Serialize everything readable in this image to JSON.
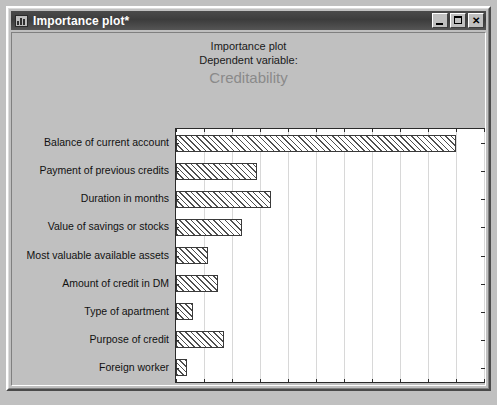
{
  "window": {
    "title": "Importance plot*",
    "icon": "bar-chart-icon",
    "buttons": {
      "minimize": "_",
      "maximize": "□",
      "close": "✕"
    }
  },
  "chart_data": {
    "type": "bar",
    "orientation": "horizontal",
    "title": "Importance plot",
    "subtitle": "Dependent variable:",
    "dependent_variable": "Creditability",
    "xlabel": "Importance (Chi-square)",
    "ylabel": "",
    "xlim": [
      0,
      110
    ],
    "xticks": [
      0,
      10,
      20,
      30,
      40,
      50,
      60,
      70,
      80,
      90,
      100,
      110
    ],
    "grid": true,
    "legend": null,
    "categories": [
      "Balance of current account",
      "Payment of previous credits",
      "Duration in months",
      "Value of savings or stocks",
      "Most valuable available assets",
      "Amount of credit in DM",
      "Type of apartment",
      "Purpose of credit",
      "Foreign worker"
    ],
    "values": [
      100,
      29,
      34,
      23.5,
      11.5,
      15,
      6,
      17,
      4
    ],
    "bar_style": {
      "fill": "diagonal-hatch",
      "edge_color": "#3a3a3a",
      "face_color": "#ffffff"
    }
  },
  "colors": {
    "window_face": "#c0c0c0",
    "titlebar": "#3c3c3c",
    "plot_background": "#ffffff",
    "subtitle_gray": "#8a8a8a",
    "gridline": "#d8d8d8",
    "axis": "#2b2b2b"
  }
}
